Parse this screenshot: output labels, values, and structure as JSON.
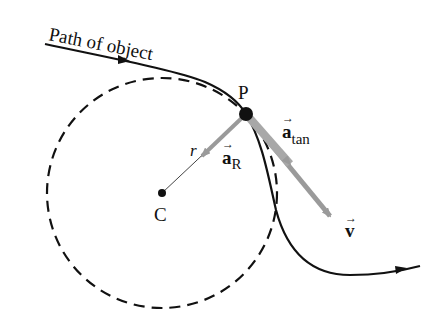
{
  "diagram": {
    "title_label": "Path of object",
    "point_label": "P",
    "center_label": "C",
    "radius_label": "r",
    "radial_accel": {
      "symbol": "a",
      "subscript": "R",
      "arrow": "→"
    },
    "tangential_accel": {
      "symbol": "a",
      "subscript": "tan",
      "arrow": "→"
    },
    "velocity": {
      "symbol": "v",
      "arrow": "→"
    },
    "colors": {
      "path": "#111111",
      "vector": "#9a9a9a",
      "circle": "#111111",
      "background": "#ffffff"
    }
  }
}
